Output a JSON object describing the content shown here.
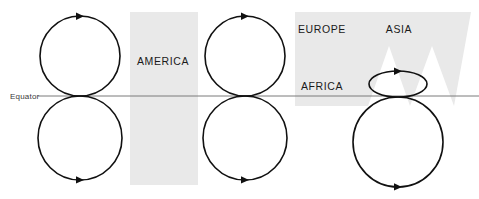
{
  "figure": {
    "background_color": "#ffffff",
    "width": 479,
    "height": 199
  },
  "colors": {
    "landmass_fill": "#e9e9e9",
    "orbit_stroke": "#111111",
    "equator_stroke": "#7a7a7a",
    "label_text": "#1a1a1a",
    "equator_text": "#3a3a3a"
  },
  "equator": {
    "label": "Equator",
    "label_x": 10,
    "label_y": 97,
    "line_y": 96,
    "line_x1": 38,
    "line_x2": 479
  },
  "landmasses": [
    {
      "name": "america",
      "label": "AMERICA",
      "label_x": 163,
      "label_y": 65,
      "shape": "rect",
      "x": 130,
      "y": 12,
      "width": 68,
      "height": 173
    },
    {
      "name": "eurasia-africa",
      "label_europe": "EUROPE",
      "label_europe_x": 322,
      "label_europe_y": 33,
      "label_asia": "ASIA",
      "label_asia_x": 399,
      "label_asia_y": 33,
      "label_africa": "AFRICA",
      "label_africa_x": 322,
      "label_africa_y": 90,
      "shape": "notched-polygon",
      "points": "295,12 471,12 454,106 432,46 410,106 389,46 368,106 352,106 352,96 352,12"
    }
  ],
  "orbit_groups": [
    {
      "name": "left-pair",
      "center_x": 80,
      "top_circle": {
        "cx": 80,
        "cy": 56,
        "rx": 40,
        "ry": 40,
        "arrow_direction": "clockwise",
        "arrow_at": "top"
      },
      "bottom_circle": {
        "cx": 80,
        "cy": 138,
        "rx": 42,
        "ry": 42,
        "arrow_direction": "clockwise",
        "arrow_at": "bottom"
      }
    },
    {
      "name": "middle-pair",
      "center_x": 245,
      "top_circle": {
        "cx": 245,
        "cy": 56,
        "rx": 40,
        "ry": 40,
        "arrow_direction": "clockwise",
        "arrow_at": "top"
      },
      "bottom_circle": {
        "cx": 245,
        "cy": 138,
        "rx": 42,
        "ry": 42,
        "arrow_direction": "clockwise",
        "arrow_at": "bottom"
      }
    },
    {
      "name": "right-pair",
      "center_x": 398,
      "top_circle": {
        "cx": 398,
        "cy": 84,
        "rx": 29,
        "ry": 13,
        "arrow_direction": "clockwise",
        "arrow_at": "top"
      },
      "bottom_circle": {
        "cx": 398,
        "cy": 142,
        "rx": 45,
        "ry": 45,
        "arrow_direction": "clockwise",
        "arrow_at": "bottom"
      }
    }
  ]
}
